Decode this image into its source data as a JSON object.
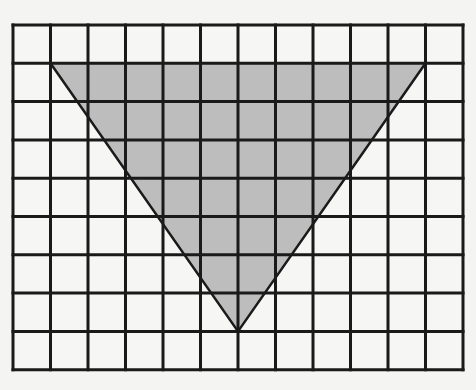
{
  "diagram": {
    "type": "grid-with-shaded-triangle",
    "grid": {
      "columns": 12,
      "rows": 9,
      "left": 13,
      "top": 25,
      "cell_width": 37.5,
      "cell_height": 38.3,
      "line_color": "#1a1a1a",
      "line_width": 3,
      "background": "#f6f6f4"
    },
    "triangle": {
      "vertices_grid": [
        [
          1,
          1
        ],
        [
          11,
          1
        ],
        [
          6,
          8
        ]
      ],
      "fill": "#bdbdbd",
      "stroke": "#1a1a1a",
      "stroke_width": 2.5,
      "orientation": "inverted"
    }
  }
}
